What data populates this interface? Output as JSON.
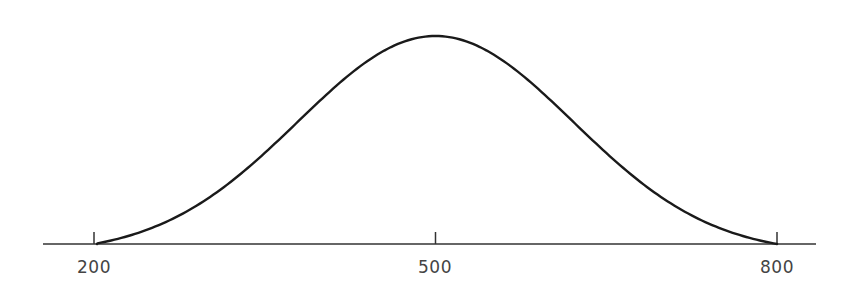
{
  "chart_data": {
    "type": "line",
    "title": "",
    "xlabel": "",
    "ylabel": "",
    "distribution": {
      "shape": "normal",
      "mean": 500,
      "sd": 121
    },
    "x": [
      200,
      250,
      300,
      350,
      400,
      450,
      500,
      550,
      600,
      650,
      700,
      750,
      800
    ],
    "values": [
      0.0,
      0.11,
      0.26,
      0.46,
      0.69,
      0.9,
      1.0,
      0.9,
      0.69,
      0.46,
      0.26,
      0.11,
      0.0
    ],
    "xlim": [
      160,
      860
    ],
    "x_ticks": [
      200,
      500,
      800
    ],
    "x_tick_labels": [
      "200",
      "500",
      "800"
    ],
    "y_axis_visible": false,
    "grid": false,
    "legend": null,
    "line_color": "#1a1a1a",
    "axis_color": "#333333"
  }
}
